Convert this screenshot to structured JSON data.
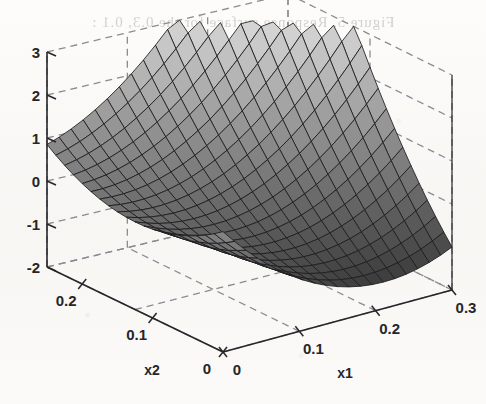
{
  "figure": {
    "type": "surface-plot-3d",
    "background_color": "#fbfaf8",
    "ink_color": "#26262a",
    "grid_color": "#8c8c90",
    "bleed_through_text": "Figure 5.  Response surface   for the   0.3, 0.1 :"
  },
  "axes": {
    "x1": {
      "title": "x1",
      "ticks": [
        "0",
        "0.1",
        "0.2",
        "0.3"
      ],
      "values": [
        0,
        0.1,
        0.2,
        0.3
      ],
      "range": [
        0,
        0.3
      ]
    },
    "x2": {
      "title": "x2",
      "ticks": [
        "0",
        "0.1",
        "0.2"
      ],
      "values": [
        0,
        0.1,
        0.2
      ],
      "range": [
        0,
        0.25
      ]
    },
    "z": {
      "title": "",
      "ticks": [
        "3",
        "2",
        "1",
        "0",
        "-1",
        "-2"
      ],
      "values": [
        3,
        2,
        1,
        0,
        -1,
        -2
      ],
      "range": [
        -2,
        3
      ]
    }
  },
  "chart_data": {
    "type": "surface",
    "title": "",
    "xlabel": "x1",
    "ylabel": "x2",
    "zlabel": "",
    "xlim": [
      0,
      0.3
    ],
    "ylim": [
      0,
      0.25
    ],
    "zlim": [
      -2,
      3
    ],
    "grid": true,
    "legend": "none",
    "colormap": "gray",
    "mesh": {
      "nx": 21,
      "ny": 21,
      "line_color": "#1c1c1f"
    },
    "view": {
      "azimuth": -37.5,
      "elevation": 30
    },
    "corner_values": {
      "x1_0_x2_0": 0.8,
      "x1_0_x2_max": 0.85,
      "x1_max_x2_0": -1.0,
      "x1_max_x2_max": 3.2
    },
    "surface_model": {
      "form": "z = a + b1*u + b2*v + b11*u^2 + b22*v^2 + b12*u*v",
      "u_is": "x1 scaled to 0..1 over [0,0.3]",
      "v_is": "x2 scaled to 0..1 over [0,0.25]",
      "a": 0.8,
      "b1": -6.2,
      "b2": -3.1,
      "b11": 4.4,
      "b22": 3.15,
      "b12": 8.0
    },
    "sampled_z_grid_5x5": {
      "u_values": [
        0,
        0.25,
        0.5,
        0.75,
        1.0
      ],
      "v_values": [
        0,
        0.25,
        0.5,
        0.75,
        1.0
      ],
      "z": [
        [
          0.8,
          -0.48,
          -1.3,
          -1.55,
          -1.25
        ],
        [
          0.22,
          -0.56,
          -0.88,
          -0.63,
          0.18
        ],
        [
          -0.08,
          -0.36,
          -0.18,
          0.57,
          1.85
        ],
        [
          -0.11,
          0.13,
          0.81,
          2.03,
          3.8
        ],
        [
          0.13,
          0.87,
          2.05,
          3.78,
          6.05
        ]
      ],
      "note": "grid indexed [v][u]; values above zlim are clipped by the axes box"
    }
  },
  "ticks_text": {
    "z": [
      "3",
      "2",
      "1",
      "0",
      "-1",
      "-2"
    ],
    "x1": [
      "0",
      "0.1",
      "0.2",
      "0.3"
    ],
    "x2": [
      "0",
      "0.1",
      "0.2"
    ]
  }
}
